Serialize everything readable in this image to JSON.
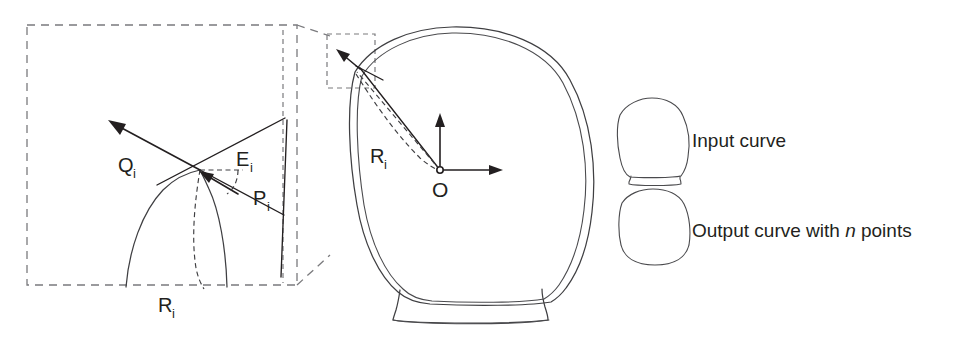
{
  "figure": {
    "background_color": "#ffffff",
    "line_color": "#3f3f42",
    "dash_color": "#7a7a7d",
    "vector_color": "#231f20",
    "width": 966,
    "height": 339
  },
  "detail_inset": {
    "name": "magnified-detail-box",
    "labels": {
      "q": "Q",
      "q_sub": "i",
      "e": "E",
      "e_sub": "i",
      "p": "P",
      "p_sub": "i",
      "r": "R",
      "r_sub": "i"
    }
  },
  "main_shape": {
    "name": "input-output-curve-pair",
    "radius_label": "R",
    "radius_sub": "i",
    "origin_label": "O"
  },
  "legend": {
    "items": [
      {
        "icon": "input-curve-glyph",
        "label": "Input curve",
        "emphasis": "",
        "label_tail": ""
      },
      {
        "icon": "output-curve-glyph",
        "label": "Output curve with ",
        "emphasis": "n",
        "label_tail": " points"
      }
    ]
  }
}
